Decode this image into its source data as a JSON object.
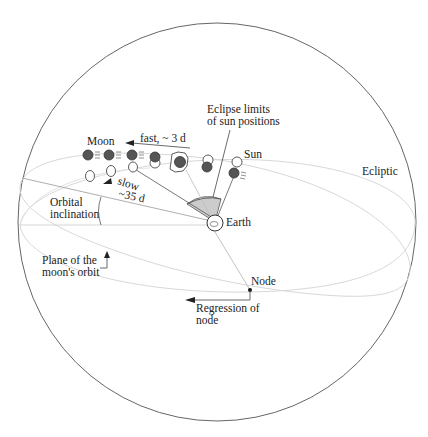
{
  "diagram": {
    "type": "celestial-sphere-eclipse-diagram",
    "colors": {
      "outline": "#555555",
      "orbit_line": "#d8d8d8",
      "pointer_line": "#444444",
      "moon_fill": "#555555",
      "sector_fill": "#cccccc",
      "text": "#222222"
    },
    "labels": {
      "moon": "Moon",
      "fast": "fast, ~ 3 d",
      "slow_line1": "slow",
      "slow_line2": "~35 d",
      "eclipse_limits_line1": "Eclipse limits",
      "eclipse_limits_line2": "of sun positions",
      "sun": "Sun",
      "ecliptic": "Ecliptic",
      "orbital_inclination_line1": "Orbital",
      "orbital_inclination_line2": "inclination",
      "earth": "Earth",
      "plane_line1": "Plane of the",
      "plane_line2": "moon's orbit",
      "node": "Node",
      "regression_line1": "Regression of",
      "regression_line2": "node"
    },
    "elements": [
      "celestial-sphere",
      "ecliptic-ellipse",
      "moon-orbit-ellipse",
      "earth",
      "eclipse-limit-sector",
      "moon-sequence",
      "sun-sequence",
      "node-point"
    ]
  }
}
